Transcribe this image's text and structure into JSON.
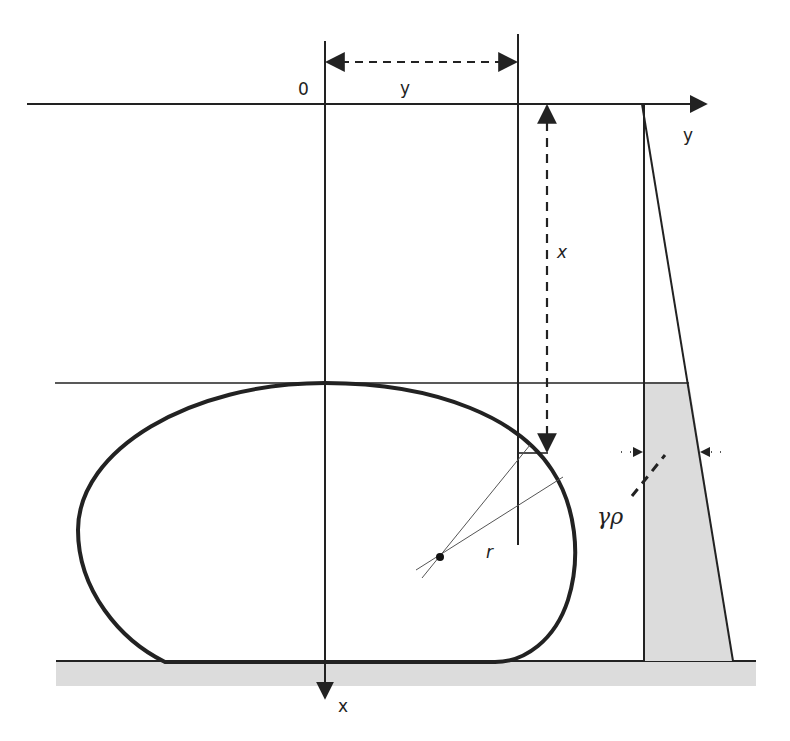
{
  "figure": {
    "type": "Liquid drop on a horizontal surface with hydrostatic pressure distribution",
    "labels": {
      "origin": "0",
      "y_dimension": "y",
      "y_axis": "y",
      "x_dimension": "x",
      "x_axis": "x",
      "radius": "r",
      "pressure": "γρ"
    },
    "colors": {
      "line": "#222222",
      "fill_gray": "#dcdcdc",
      "background": "#ffffff"
    }
  }
}
